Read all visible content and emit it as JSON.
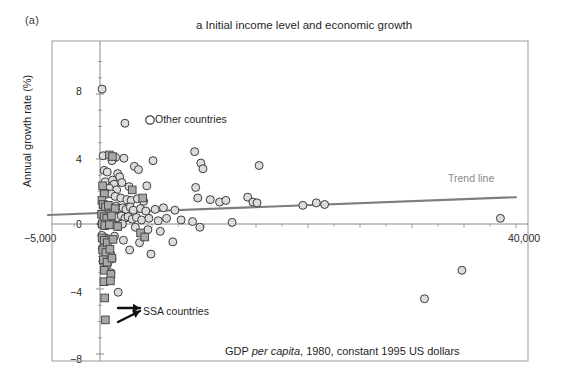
{
  "figure": {
    "panel_label": "(a)",
    "title": "a Initial income level and economic growth",
    "ylabel": "Annual growth rate (%)",
    "xcaption_pre": "GDP ",
    "xcaption_italic": "per capita",
    "xcaption_post": ", 1980, constant 1995 US dollars"
  },
  "annotations": {
    "other_countries": "Other countries",
    "ssa_countries": "SSA countries",
    "trend_line": "Trend line"
  },
  "axis_labels": {
    "y_8": "8",
    "y_4": "4",
    "y_0": "0",
    "y_m4": "−4",
    "y_m8": "−8",
    "x_left": "−5,000",
    "x_right": "40,000"
  },
  "colors": {
    "circle_fill": "#dcdcdc",
    "circle_stroke": "#3c3c3c",
    "square_fill": "#a8a8a8",
    "square_stroke": "#4a4a4a",
    "trend_line": "#7d7d7d",
    "axis": "#8a8a8a",
    "frame": "#9a9a9a",
    "text": "#1f1f1f"
  },
  "chart_data": {
    "type": "scatter",
    "title": "a Initial income level and economic growth",
    "xlabel": "GDP per capita, 1980, constant 1995 US dollars",
    "ylabel": "Annual growth rate (%)",
    "xlim": [
      -5000,
      40000
    ],
    "ylim": [
      -8,
      10
    ],
    "xticks": [
      -5000,
      40000
    ],
    "yticks": [
      8,
      4,
      0,
      -4,
      -8
    ],
    "grid": false,
    "legend": [
      "Other countries",
      "SSA countries"
    ],
    "trendline": {
      "label": "Trend line",
      "x": [
        -5000,
        40000
      ],
      "y": [
        0.55,
        1.65
      ]
    },
    "series": [
      {
        "name": "Other countries",
        "marker": "circle",
        "points": [
          [
            200,
            8.3
          ],
          [
            2400,
            6.2
          ],
          [
            300,
            4.2
          ],
          [
            1500,
            4.1
          ],
          [
            2300,
            4.05
          ],
          [
            1150,
            3.9
          ],
          [
            3300,
            3.55
          ],
          [
            3700,
            3.35
          ],
          [
            5100,
            3.9
          ],
          [
            9100,
            4.45
          ],
          [
            9700,
            3.75
          ],
          [
            9900,
            3.4
          ],
          [
            400,
            3.3
          ],
          [
            700,
            3.2
          ],
          [
            1700,
            3.1
          ],
          [
            1900,
            2.9
          ],
          [
            500,
            2.6
          ],
          [
            1200,
            2.7
          ],
          [
            2100,
            2.55
          ],
          [
            1350,
            2.45
          ],
          [
            2800,
            2.3
          ],
          [
            4500,
            2.35
          ],
          [
            900,
            2.2
          ],
          [
            1600,
            2.1
          ],
          [
            9200,
            2.25
          ],
          [
            15300,
            3.6
          ],
          [
            600,
            1.9
          ],
          [
            1100,
            1.85
          ],
          [
            1450,
            1.7
          ],
          [
            2000,
            1.6
          ],
          [
            2600,
            1.5
          ],
          [
            3000,
            1.45
          ],
          [
            3600,
            1.55
          ],
          [
            4200,
            1.4
          ],
          [
            9400,
            1.6
          ],
          [
            10600,
            1.5
          ],
          [
            11500,
            1.35
          ],
          [
            12100,
            1.45
          ],
          [
            14200,
            1.65
          ],
          [
            14700,
            1.35
          ],
          [
            15100,
            1.3
          ],
          [
            350,
            1.2
          ],
          [
            800,
            1.15
          ],
          [
            1050,
            1.05
          ],
          [
            1550,
            1.1
          ],
          [
            1800,
            0.95
          ],
          [
            2200,
            1.0
          ],
          [
            2500,
            0.9
          ],
          [
            2900,
            1.05
          ],
          [
            3200,
            0.85
          ],
          [
            3900,
            0.95
          ],
          [
            4400,
            0.8
          ],
          [
            5300,
            0.9
          ],
          [
            6100,
            1.0
          ],
          [
            7200,
            0.85
          ],
          [
            19500,
            1.15
          ],
          [
            20800,
            1.3
          ],
          [
            21600,
            1.2
          ],
          [
            250,
            0.6
          ],
          [
            550,
            0.5
          ],
          [
            950,
            0.45
          ],
          [
            1250,
            0.55
          ],
          [
            1650,
            0.4
          ],
          [
            2050,
            0.5
          ],
          [
            2400,
            0.35
          ],
          [
            2700,
            0.45
          ],
          [
            3100,
            0.3
          ],
          [
            3500,
            0.4
          ],
          [
            4000,
            0.25
          ],
          [
            4700,
            0.35
          ],
          [
            5600,
            0.2
          ],
          [
            6400,
            0.35
          ],
          [
            7800,
            0.25
          ],
          [
            8900,
            0.15
          ],
          [
            12700,
            0.1
          ],
          [
            150,
            0.0
          ],
          [
            450,
            -0.1
          ],
          [
            750,
            0.05
          ],
          [
            1300,
            -0.05
          ],
          [
            1750,
            -0.15
          ],
          [
            2150,
            0.0
          ],
          [
            3400,
            -0.2
          ],
          [
            4600,
            -0.35
          ],
          [
            5800,
            -0.45
          ],
          [
            9600,
            -0.2
          ],
          [
            38500,
            0.35
          ],
          [
            180,
            -0.7
          ],
          [
            520,
            -0.85
          ],
          [
            880,
            -0.95
          ],
          [
            1400,
            -0.75
          ],
          [
            2250,
            -1.0
          ],
          [
            3800,
            -1.15
          ],
          [
            7000,
            -1.1
          ],
          [
            220,
            -1.5
          ],
          [
            620,
            -1.65
          ],
          [
            1000,
            -1.8
          ],
          [
            4900,
            -1.85
          ],
          [
            2850,
            -1.6
          ],
          [
            280,
            -2.3
          ],
          [
            700,
            -2.5
          ],
          [
            1150,
            -2.15
          ],
          [
            1050,
            -3.0
          ],
          [
            34800,
            -2.85
          ],
          [
            1750,
            -4.2
          ],
          [
            31200,
            -4.6
          ]
        ]
      },
      {
        "name": "SSA countries",
        "marker": "square",
        "points": [
          [
            900,
            4.25
          ],
          [
            1200,
            4.15
          ],
          [
            250,
            2.35
          ],
          [
            420,
            1.85
          ],
          [
            3100,
            2.1
          ],
          [
            4100,
            1.6
          ],
          [
            180,
            1.45
          ],
          [
            300,
            1.2
          ],
          [
            520,
            1.05
          ],
          [
            800,
            1.15
          ],
          [
            1450,
            0.95
          ],
          [
            150,
            0.6
          ],
          [
            380,
            0.45
          ],
          [
            640,
            0.35
          ],
          [
            1100,
            0.5
          ],
          [
            220,
            0.0
          ],
          [
            460,
            -0.1
          ],
          [
            900,
            -0.05
          ],
          [
            1700,
            -0.15
          ],
          [
            3900,
            -0.55
          ],
          [
            4300,
            -0.8
          ],
          [
            200,
            -0.85
          ],
          [
            400,
            -1.0
          ],
          [
            700,
            -1.15
          ],
          [
            1250,
            -0.95
          ],
          [
            260,
            -1.6
          ],
          [
            560,
            -1.75
          ],
          [
            950,
            -1.55
          ],
          [
            320,
            -2.2
          ],
          [
            680,
            -2.35
          ],
          [
            1150,
            -2.1
          ],
          [
            420,
            -2.85
          ],
          [
            1050,
            -3.1
          ],
          [
            380,
            -3.55
          ],
          [
            1000,
            -3.5
          ],
          [
            450,
            -4.55
          ],
          [
            520,
            -5.9
          ]
        ]
      }
    ]
  }
}
